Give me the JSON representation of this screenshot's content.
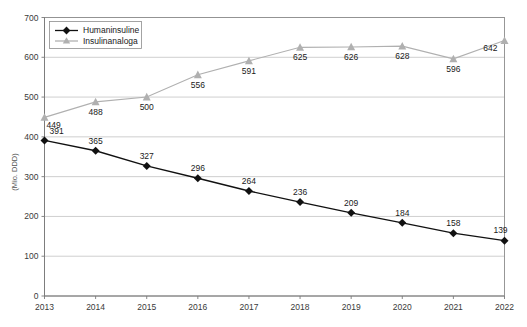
{
  "chart_data": {
    "type": "line",
    "title": "",
    "xlabel": "",
    "ylabel": "(Mio. DDD)",
    "categories": [
      "2013",
      "2014",
      "2015",
      "2016",
      "2017",
      "2018",
      "2019",
      "2020",
      "2021",
      "2022"
    ],
    "ylim": [
      0,
      700
    ],
    "yticks": [
      0,
      100,
      200,
      300,
      400,
      500,
      600,
      700
    ],
    "grid": true,
    "legend_position": "top-left",
    "series": [
      {
        "name": "Humaninsuline",
        "color": "#111111",
        "marker": "diamond",
        "values": [
          391,
          365,
          327,
          296,
          264,
          236,
          209,
          184,
          158,
          139
        ]
      },
      {
        "name": "Insulinanaloga",
        "color": "#b0b0b0",
        "marker": "triangle",
        "values": [
          449,
          488,
          500,
          556,
          591,
          625,
          626,
          628,
          596,
          642
        ]
      }
    ]
  },
  "axis": {
    "y_tick_labels": [
      "0",
      "100",
      "200",
      "300",
      "400",
      "500",
      "600",
      "700"
    ],
    "x_tick_labels": [
      "2013",
      "2014",
      "2015",
      "2016",
      "2017",
      "2018",
      "2019",
      "2020",
      "2021",
      "2022"
    ],
    "y_axis_title": "(Mio. DDD)"
  },
  "legend": {
    "items": [
      {
        "label": "Humaninsuline",
        "icon": "diamond-marker-icon",
        "color": "#111111"
      },
      {
        "label": "Insulinanaloga",
        "icon": "triangle-marker-icon",
        "color": "#b0b0b0"
      }
    ]
  },
  "data_labels": {
    "humaninsuline": [
      "391",
      "365",
      "327",
      "296",
      "264",
      "236",
      "209",
      "184",
      "158",
      "139"
    ],
    "insulinanaloga": [
      "449",
      "488",
      "500",
      "556",
      "591",
      "625",
      "626",
      "628",
      "596",
      "642"
    ]
  },
  "colors": {
    "series_1": "#111111",
    "series_2": "#b0b0b0",
    "grid": "#b9b9b9",
    "axis": "#7a7a7a",
    "background": "#ffffff"
  }
}
